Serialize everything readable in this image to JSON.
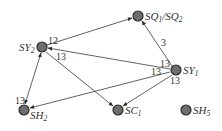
{
  "diagram": {
    "type": "directed-graph",
    "colors": {
      "node_fill": "#6e6e6e",
      "node_stroke": "#2a2a2a",
      "edge": "#3a3a3a",
      "text": "#333333"
    },
    "nodes": [
      {
        "id": "SY2",
        "base": "SY",
        "sub": "2",
        "x": 42,
        "y": 47,
        "label_pos": "left"
      },
      {
        "id": "SQ",
        "base": "SQ",
        "sub": "1",
        "base2": "/SQ",
        "sub2": "2",
        "x": 138,
        "y": 16,
        "label_pos": "right"
      },
      {
        "id": "SY1",
        "base": "SY",
        "sub": "1",
        "x": 176,
        "y": 70,
        "label_pos": "right"
      },
      {
        "id": "SH2",
        "base": "SH",
        "sub": "2",
        "x": 24,
        "y": 110,
        "label_pos": "right-below"
      },
      {
        "id": "SC1",
        "base": "SC",
        "sub": "1",
        "x": 118,
        "y": 110,
        "label_pos": "right"
      },
      {
        "id": "SH5",
        "base": "SH",
        "sub": "5",
        "x": 186,
        "y": 110,
        "label_pos": "right"
      }
    ],
    "edges": [
      {
        "from": "SY2",
        "to": "SQ",
        "label": "12",
        "direction": "forward"
      },
      {
        "from": "SY1",
        "to": "SQ",
        "label": "3",
        "direction": "forward"
      },
      {
        "from": "SY1",
        "to": "SY2",
        "label": "13",
        "direction": "forward"
      },
      {
        "from": "SY1",
        "to": "SH2",
        "label": "13",
        "direction": "forward"
      },
      {
        "from": "SY1",
        "to": "SC1",
        "label": "13",
        "direction": "forward"
      },
      {
        "from": "SY2",
        "to": "SC1",
        "label": "13",
        "direction": "forward"
      },
      {
        "from": "SH2",
        "to": "SY2",
        "label": "13",
        "direction": "both"
      }
    ]
  }
}
